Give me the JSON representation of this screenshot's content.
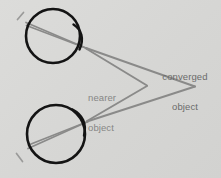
{
  "figure": {
    "background_color": "#d9d9d7",
    "width": 221,
    "height": 178
  },
  "labels": {
    "nearer_object": {
      "line1": "nearer",
      "line2": "object",
      "color": "#868685"
    },
    "converged_object": {
      "line1": "converged",
      "line2": "object",
      "color": "#6b6b6a"
    }
  },
  "diagram": {
    "eye_outline_color": "#151515",
    "ray_color": "#8a8a89",
    "tick_color": "#9a9a99",
    "eyes": [
      {
        "name": "upper-eye",
        "center_x": 53,
        "center_y": 36,
        "radius": 27,
        "lens_x": 80,
        "lens_y": 36
      },
      {
        "name": "lower-eye",
        "center_x": 56,
        "center_y": 134,
        "radius": 29,
        "lens_x": 84,
        "lens_y": 132
      }
    ],
    "points": {
      "nearer_object_vertex_x": 146,
      "nearer_object_vertex_y": 85,
      "converged_object_vertex_x": 194,
      "converged_object_vertex_y": 86
    }
  }
}
